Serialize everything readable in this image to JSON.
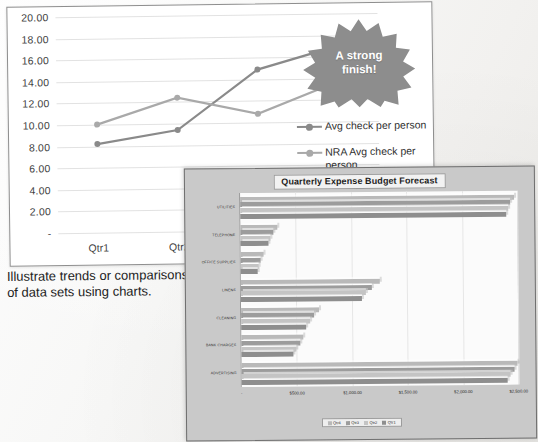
{
  "document": {
    "caption": "Illustrate trends or comparisons of data sets using charts."
  },
  "line_chart": {
    "callout": {
      "line1": "A strong",
      "line2": "finish!"
    },
    "legend": [
      {
        "label": "Avg check per person",
        "color": "#8a8a8a"
      },
      {
        "label": "NRA Avg check per person",
        "color": "#a9a9a9"
      }
    ]
  },
  "bar_chart": {
    "title": "Quarterly Expense Budget Forecast"
  },
  "chart_data": [
    {
      "type": "line",
      "title": "",
      "xlabel": "",
      "ylabel": "",
      "categories": [
        "Qtr1",
        "Qtr2",
        "Qtr3",
        "Qtr4"
      ],
      "visible_categories": [
        "Qtr1",
        "Qtr2"
      ],
      "ylim": [
        0,
        20
      ],
      "yticks": [
        "-",
        "2.00",
        "4.00",
        "6.00",
        "8.00",
        "10.00",
        "12.00",
        "14.00",
        "16.00",
        "18.00",
        "20.00"
      ],
      "grid": true,
      "legend_position": "right",
      "series": [
        {
          "name": "Avg check per person",
          "values": [
            8.2,
            9.4,
            14.9,
            17.0
          ],
          "color": "#8a8a8a"
        },
        {
          "name": "NRA Avg check per person",
          "values": [
            10.0,
            12.4,
            10.8,
            13.7
          ],
          "color": "#a9a9a9"
        }
      ]
    },
    {
      "type": "bar",
      "orientation": "horizontal",
      "title": "Quarterly Expense Budget Forecast",
      "xlabel": "",
      "ylabel": "",
      "categories": [
        "UTILITIES",
        "TELEPHONE",
        "OFFICE SUPPLIES",
        "LINENS",
        "CLEANING",
        "BANK CHARGES",
        "ADVERTISING"
      ],
      "xlim": [
        0,
        2500
      ],
      "xticks": [
        "-",
        "$500.00",
        "$1,000.00",
        "$1,500.00",
        "$2,000.00",
        "$2,500.00"
      ],
      "grid": true,
      "legend_position": "bottom",
      "series": [
        {
          "name": "Qtr4",
          "color": "#b9b9b9",
          "values": [
            2470,
            330,
            205,
            1250,
            700,
            560,
            2490
          ]
        },
        {
          "name": "Qtr3",
          "color": "#9c9c9c",
          "values": [
            2440,
            300,
            185,
            1180,
            660,
            530,
            2460
          ]
        },
        {
          "name": "Qtr2",
          "color": "#c4c4c4",
          "values": [
            2420,
            275,
            165,
            1130,
            620,
            500,
            2430
          ]
        },
        {
          "name": "Qtr1",
          "color": "#8e8e8e",
          "values": [
            2400,
            250,
            150,
            1090,
            590,
            470,
            2400
          ]
        }
      ]
    }
  ]
}
